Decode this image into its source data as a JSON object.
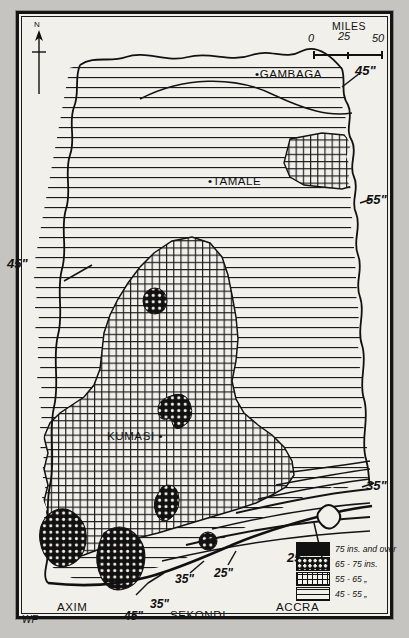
{
  "map": {
    "title": "Rainfall map of Ghana",
    "signature": "WF",
    "north_label": "N",
    "paper_color": "#f2f0eb",
    "ink_color": "#111111"
  },
  "scale_bar": {
    "title": "MILES",
    "ticks": [
      "0",
      "25",
      "50"
    ]
  },
  "places": [
    {
      "name": "GAMBAGA",
      "label": "•GAMBAGA"
    },
    {
      "name": "TAMALE",
      "label": "•TAMALE"
    },
    {
      "name": "KUMASI",
      "label": "KUMASI •"
    },
    {
      "name": "AXIM",
      "label": "AXIM"
    },
    {
      "name": "SEKONDI",
      "label": "SEKONDI"
    },
    {
      "name": "ACCRA",
      "label": "ACCRA"
    }
  ],
  "isohyet_labels": [
    {
      "id": "top-right-45",
      "text": "45\""
    },
    {
      "id": "right-55",
      "text": "55\""
    },
    {
      "id": "left-45",
      "text": "45\""
    },
    {
      "id": "right-35",
      "text": "35\""
    },
    {
      "id": "accra-25",
      "text": "25\""
    },
    {
      "id": "coast-25",
      "text": "25\""
    },
    {
      "id": "coast-35",
      "text": "35\""
    },
    {
      "id": "sekondi-35",
      "text": "35\""
    },
    {
      "id": "axim-45",
      "text": "45\""
    }
  ],
  "legend": {
    "entries": [
      {
        "swatch": "solid",
        "label": "75 ins. and over"
      },
      {
        "swatch": "dots",
        "label": "65 - 75 ins."
      },
      {
        "swatch": "grid",
        "label": "55 - 65  „"
      },
      {
        "swatch": "lines",
        "label": "45 - 55  „"
      }
    ]
  }
}
